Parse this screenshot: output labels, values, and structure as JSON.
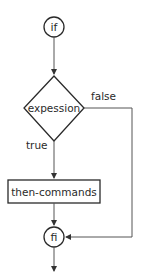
{
  "diagram": {
    "type": "flowchart",
    "colors": {
      "stroke": "#2a2a2a",
      "connector": "#555555",
      "text": "#2a2a2a",
      "background": "#ffffff"
    },
    "nodes": {
      "start": {
        "label": "if",
        "shape": "circle"
      },
      "condition": {
        "label": "expession",
        "shape": "diamond"
      },
      "then_block": {
        "label": "then-commands",
        "shape": "rectangle"
      },
      "end": {
        "label": "fi",
        "shape": "circle"
      }
    },
    "edges": {
      "true_label": "true",
      "false_label": "false"
    }
  }
}
